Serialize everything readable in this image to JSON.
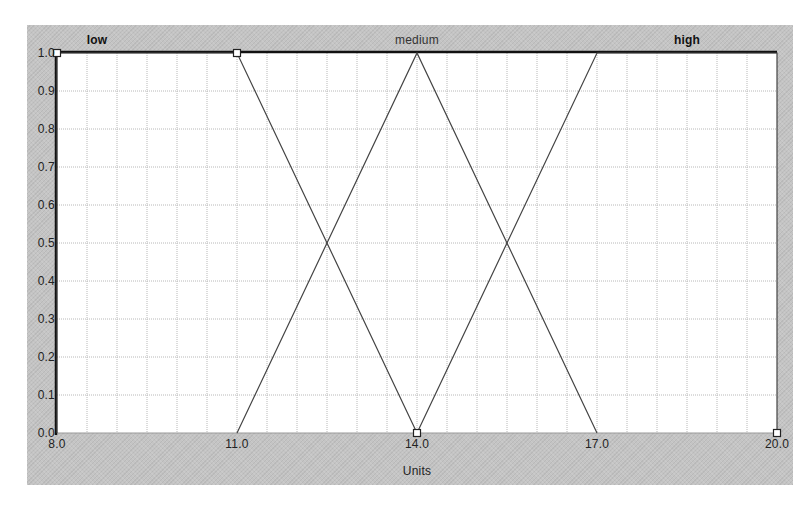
{
  "chart_data": {
    "type": "line",
    "title": "",
    "xlabel": "Units",
    "ylabel": "",
    "xlim": [
      8.0,
      20.0
    ],
    "ylim": [
      0.0,
      1.0
    ],
    "grid": true,
    "x_ticks": [
      "8.0",
      "11.0",
      "14.0",
      "17.0",
      "20.0"
    ],
    "y_ticks": [
      "0.0",
      "0.1",
      "0.2",
      "0.3",
      "0.4",
      "0.5",
      "0.6",
      "0.7",
      "0.8",
      "0.9",
      "1.0"
    ],
    "legend_position": "top (set labels above plot)",
    "series": [
      {
        "name": "low",
        "shape": "trapezoid",
        "points": [
          [
            8.0,
            0.0
          ],
          [
            8.0,
            1.0
          ],
          [
            11.0,
            1.0
          ],
          [
            14.0,
            0.0
          ]
        ]
      },
      {
        "name": "medium",
        "shape": "triangle",
        "points": [
          [
            11.0,
            0.0
          ],
          [
            14.0,
            1.0
          ],
          [
            17.0,
            0.0
          ]
        ]
      },
      {
        "name": "high",
        "shape": "trapezoid",
        "points": [
          [
            14.0,
            0.0
          ],
          [
            17.0,
            1.0
          ],
          [
            20.0,
            1.0
          ],
          [
            20.0,
            0.0
          ]
        ]
      }
    ],
    "markers": [
      [
        8.0,
        1.0
      ],
      [
        11.0,
        1.0
      ],
      [
        14.0,
        0.0
      ],
      [
        20.0,
        0.0
      ]
    ],
    "intersections": [
      [
        12.5,
        0.5
      ],
      [
        15.5,
        0.5
      ]
    ]
  },
  "labels": {
    "sets": [
      {
        "text": "low",
        "x": 11.0,
        "bold": true
      },
      {
        "text": "medium",
        "x": 14.0,
        "bold": false
      },
      {
        "text": "high",
        "x": 18.5,
        "bold": true
      }
    ],
    "x_axis_title": "Units"
  },
  "colors": {
    "panel": "#c4c4c4",
    "plot_bg": "#ffffff",
    "grid": "#b8b8b8",
    "curve": "#444444",
    "axis": "#111111"
  }
}
